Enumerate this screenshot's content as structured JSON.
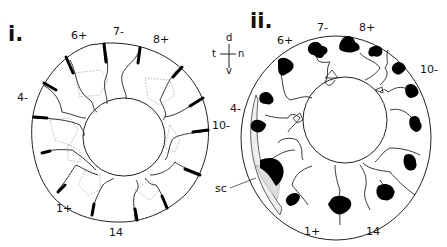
{
  "panels": [
    {
      "title": "i.",
      "labels": {
        "l6": "6+",
        "l7": "7-",
        "l8": "8+",
        "l4": "4-",
        "l10": "10-",
        "l1": "1+",
        "l14": "14"
      }
    },
    {
      "title": "ii.",
      "labels": {
        "l6": "6+",
        "l7": "7-",
        "l8": "8+",
        "l4": "4-",
        "l10": "10-",
        "l1": "1+",
        "l14": "14",
        "sc": "sc"
      },
      "compass": {
        "d": "d",
        "t": "t",
        "n": "n",
        "v": "v"
      }
    }
  ]
}
